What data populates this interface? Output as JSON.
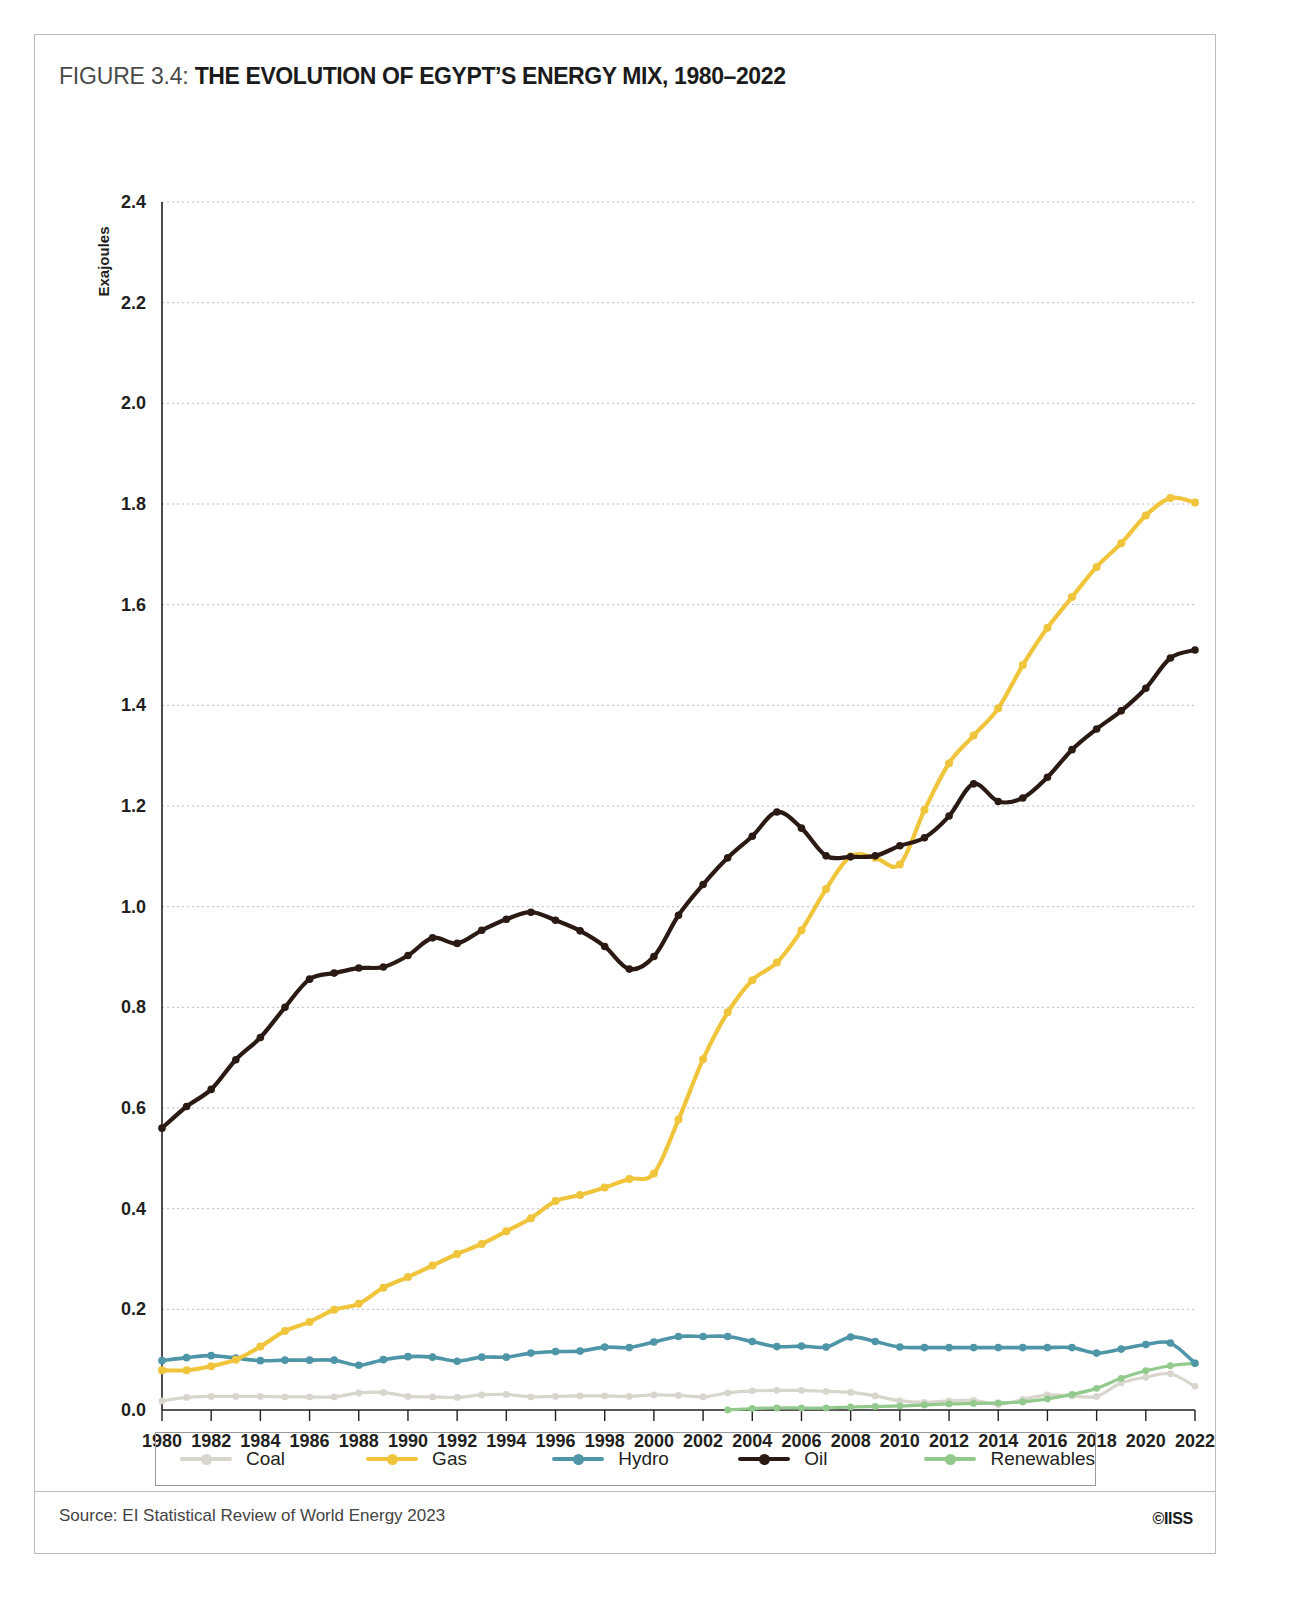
{
  "figure": {
    "label": "FIGURE 3.4:",
    "headline": "THE EVOLUTION OF EGYPT’S ENERGY MIX, 1980–2022"
  },
  "source": {
    "text": "Source: EI Statistical Review of World Energy 2023",
    "logo": "©IISS"
  },
  "legend": {
    "items": [
      {
        "label": "Coal",
        "color": "#d8d5cd"
      },
      {
        "label": "Gas",
        "color": "#f0c53c"
      },
      {
        "label": "Hydro",
        "color": "#4e95a8"
      },
      {
        "label": "Oil",
        "color": "#2b1a14"
      },
      {
        "label": "Renewables",
        "color": "#92c98c"
      }
    ]
  },
  "chart_data": {
    "type": "line",
    "title": "THE EVOLUTION OF EGYPT’S ENERGY MIX, 1980–2022",
    "xlabel": "",
    "ylabel": "Exajoules",
    "ylim": [
      0.0,
      2.4
    ],
    "xlim": [
      1980,
      2022
    ],
    "ytick_labels": [
      "0.0",
      "0.2",
      "0.4",
      "0.6",
      "0.8",
      "1.0",
      "1.2",
      "1.4",
      "1.6",
      "1.8",
      "2.0",
      "2.2",
      "2.4"
    ],
    "yticks": [
      0.0,
      0.2,
      0.4,
      0.6,
      0.8,
      1.0,
      1.2,
      1.4,
      1.6,
      1.8,
      2.0,
      2.2,
      2.4
    ],
    "xtick_labels": [
      "1980",
      "1982",
      "1984",
      "1986",
      "1988",
      "1990",
      "1992",
      "1994",
      "1996",
      "1998",
      "2000",
      "2002",
      "2004",
      "2006",
      "2008",
      "2010",
      "2012",
      "2014",
      "2016",
      "2018",
      "2020",
      "2022"
    ],
    "xticks": [
      1980,
      1982,
      1984,
      1986,
      1988,
      1990,
      1992,
      1994,
      1996,
      1998,
      2000,
      2002,
      2004,
      2006,
      2008,
      2010,
      2012,
      2014,
      2016,
      2018,
      2020,
      2022
    ],
    "grid": "horizontal",
    "legend_position": "bottom",
    "x": [
      1980,
      1981,
      1982,
      1983,
      1984,
      1985,
      1986,
      1987,
      1988,
      1989,
      1990,
      1991,
      1992,
      1993,
      1994,
      1995,
      1996,
      1997,
      1998,
      1999,
      2000,
      2001,
      2002,
      2003,
      2004,
      2005,
      2006,
      2007,
      2008,
      2009,
      2010,
      2011,
      2012,
      2013,
      2014,
      2015,
      2016,
      2017,
      2018,
      2019,
      2020,
      2021,
      2022
    ],
    "series": [
      {
        "name": "Coal",
        "color": "#d8d5cd",
        "values": [
          0.018,
          0.025,
          0.027,
          0.027,
          0.027,
          0.026,
          0.026,
          0.026,
          0.034,
          0.035,
          0.027,
          0.026,
          0.025,
          0.03,
          0.031,
          0.026,
          0.027,
          0.028,
          0.028,
          0.027,
          0.03,
          0.029,
          0.026,
          0.034,
          0.038,
          0.039,
          0.039,
          0.037,
          0.035,
          0.028,
          0.018,
          0.015,
          0.018,
          0.019,
          0.011,
          0.021,
          0.03,
          0.028,
          0.027,
          0.054,
          0.065,
          0.072,
          0.047
        ]
      },
      {
        "name": "Gas",
        "color": "#f0c53c",
        "values": [
          0.079,
          0.079,
          0.087,
          0.1,
          0.126,
          0.157,
          0.175,
          0.199,
          0.211,
          0.243,
          0.264,
          0.287,
          0.31,
          0.33,
          0.355,
          0.381,
          0.415,
          0.427,
          0.442,
          0.459,
          0.47,
          0.577,
          0.697,
          0.79,
          0.854,
          0.889,
          0.953,
          1.035,
          1.1,
          1.097,
          1.084,
          1.192,
          1.285,
          1.34,
          1.394,
          1.48,
          1.554,
          1.615,
          1.675,
          1.722,
          1.777,
          1.812,
          1.803
        ]
      },
      {
        "name": "Hydro",
        "color": "#4e95a8",
        "values": [
          0.098,
          0.104,
          0.108,
          0.103,
          0.098,
          0.099,
          0.099,
          0.099,
          0.089,
          0.1,
          0.106,
          0.105,
          0.097,
          0.105,
          0.105,
          0.113,
          0.116,
          0.117,
          0.125,
          0.124,
          0.135,
          0.146,
          0.146,
          0.146,
          0.136,
          0.126,
          0.127,
          0.125,
          0.145,
          0.136,
          0.125,
          0.124,
          0.124,
          0.124,
          0.124,
          0.124,
          0.124,
          0.124,
          0.113,
          0.121,
          0.13,
          0.133,
          0.093
        ]
      },
      {
        "name": "Oil",
        "color": "#2b1a14",
        "values": [
          0.56,
          0.603,
          0.637,
          0.696,
          0.74,
          0.8,
          0.856,
          0.868,
          0.878,
          0.88,
          0.903,
          0.938,
          0.927,
          0.953,
          0.975,
          0.989,
          0.973,
          0.952,
          0.921,
          0.876,
          0.901,
          0.983,
          1.044,
          1.097,
          1.14,
          1.188,
          1.156,
          1.101,
          1.099,
          1.101,
          1.121,
          1.137,
          1.18,
          1.244,
          1.209,
          1.216,
          1.257,
          1.312,
          1.353,
          1.389,
          1.434,
          1.494,
          1.51
        ]
      },
      {
        "name": "Renewables",
        "color": "#92c98c",
        "values": [
          null,
          null,
          null,
          null,
          null,
          null,
          null,
          null,
          null,
          null,
          null,
          null,
          null,
          null,
          null,
          null,
          null,
          null,
          null,
          null,
          null,
          null,
          null,
          0.0,
          0.003,
          0.004,
          0.004,
          0.004,
          0.006,
          0.007,
          0.008,
          0.01,
          0.012,
          0.013,
          0.014,
          0.016,
          0.022,
          0.031,
          0.043,
          0.063,
          0.078,
          0.088,
          0.093
        ]
      }
    ],
    "note_series_mapping": {
      "gas_actual": [
        0.079,
        0.079,
        0.087,
        0.1,
        0.126,
        0.157,
        0.175,
        0.199,
        0.211,
        0.243,
        0.264,
        0.287,
        0.31,
        0.33,
        0.355,
        0.381,
        0.415,
        0.427,
        0.442,
        0.459,
        0.47,
        0.577,
        0.697,
        0.79,
        0.854,
        0.889,
        0.953,
        1.035,
        1.1,
        1.097,
        1.084,
        1.192,
        1.285,
        1.34,
        1.394,
        1.48,
        1.554,
        1.615,
        1.675,
        1.722,
        1.777,
        1.812,
        1.803
      ]
    }
  },
  "chart_render": {
    "oil": [
      0.56,
      0.603,
      0.637,
      0.696,
      0.74,
      0.8,
      0.856,
      0.868,
      0.878,
      0.88,
      0.903,
      0.938,
      0.927,
      0.953,
      0.975,
      0.989,
      0.973,
      0.952,
      0.921,
      0.876,
      0.901,
      0.983,
      1.044,
      1.097,
      1.14,
      1.188,
      1.156,
      1.101,
      1.099,
      1.101,
      1.121,
      1.137,
      1.18,
      1.244,
      1.209,
      1.216,
      1.257,
      1.312,
      1.353,
      1.389,
      1.434,
      1.494,
      1.51
    ],
    "oil_full": [
      0.56,
      0.603,
      0.637,
      0.696,
      0.74,
      0.8,
      0.856,
      0.868,
      0.878,
      0.88,
      0.903,
      0.938,
      0.927,
      0.953,
      0.975,
      0.989,
      0.973,
      0.952,
      0.921,
      0.876,
      0.901,
      0.983,
      1.044,
      1.097,
      1.14,
      1.188,
      1.156,
      1.101,
      1.099,
      1.101,
      1.121,
      1.137,
      1.18,
      1.244,
      1.209,
      1.216,
      1.257,
      1.312,
      1.353,
      1.389,
      1.434,
      1.494,
      1.51
    ]
  }
}
